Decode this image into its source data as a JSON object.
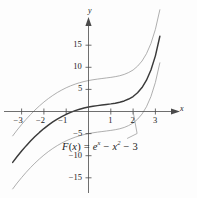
{
  "figure": {
    "background_color": "#fdfdfd",
    "axis_color": "#4a4a4a",
    "curve_main_color": "#3a3a3a",
    "curve_family_color": "#9a9a9a",
    "text_color": "#1a1a1a"
  },
  "axes": {
    "x_label": "x",
    "y_label": "y",
    "x_ticks": [
      {
        "value": -3,
        "label": "−3"
      },
      {
        "value": -2,
        "label": "−2"
      },
      {
        "value": -1,
        "label": "−1"
      },
      {
        "value": 1,
        "label": "1"
      },
      {
        "value": 2,
        "label": "2"
      },
      {
        "value": 3,
        "label": "3"
      }
    ],
    "y_ticks": [
      {
        "value": 15,
        "label": "15"
      },
      {
        "value": 10,
        "label": "10"
      },
      {
        "value": 5,
        "label": "5"
      },
      {
        "value": -5,
        "label": "−5"
      },
      {
        "value": -10,
        "label": "−10"
      },
      {
        "value": -15,
        "label": "−15"
      }
    ]
  },
  "annotation": {
    "function_text": "F(x) = e^x − x^2 − 3",
    "fx_name": "F",
    "open_paren": "(",
    "variable": "x",
    "close_paren": ")",
    "equals": "=",
    "e_base": "e",
    "e_exp": "x",
    "minus_1": "−",
    "x_term": "x",
    "x_exp": "2",
    "minus_2": "−",
    "constant": "3"
  },
  "chart_data": {
    "type": "line",
    "title": "",
    "xlabel": "x",
    "ylabel": "y",
    "xlim": [
      -3.6,
      3.4
    ],
    "ylim": [
      -19,
      19
    ],
    "grid": false,
    "legend": null,
    "annotations": [
      {
        "text": "F(x) = e^x − x^2 − 3",
        "x": 0.6,
        "y": -7.5,
        "leader_to": {
          "x": 2.0,
          "y": 0.0
        }
      }
    ],
    "x": [
      -3.4,
      -3.2,
      -3.0,
      -2.8,
      -2.6,
      -2.4,
      -2.2,
      -2.0,
      -1.8,
      -1.6,
      -1.4,
      -1.2,
      -1.0,
      -0.8,
      -0.6,
      -0.4,
      -0.2,
      0.0,
      0.2,
      0.4,
      0.6,
      0.8,
      1.0,
      1.2,
      1.4,
      1.6,
      1.8,
      2.0,
      2.2,
      2.4,
      2.6,
      2.8,
      3.0,
      3.2
    ],
    "series": [
      {
        "name": "C = 6",
        "constant": 6,
        "style": "thin",
        "color": "#9a9a9a",
        "values": [
          -5.52,
          -4.19,
          -2.95,
          -1.78,
          -0.69,
          0.33,
          1.27,
          2.14,
          2.93,
          3.64,
          4.29,
          4.86,
          5.37,
          5.81,
          6.19,
          6.51,
          6.78,
          7.0,
          7.18,
          7.33,
          7.46,
          7.59,
          7.72,
          7.88,
          8.09,
          8.39,
          8.82,
          9.39,
          10.25,
          11.42,
          13.08,
          15.39,
          18.59,
          23.02
        ]
      },
      {
        "name": "C = 0",
        "constant": 0,
        "style": "bold",
        "color": "#3a3a3a",
        "values": [
          -11.52,
          -10.19,
          -8.95,
          -7.78,
          -6.69,
          -5.67,
          -4.73,
          -3.86,
          -3.07,
          -2.36,
          -1.71,
          -1.14,
          -0.63,
          -0.19,
          0.19,
          0.51,
          0.78,
          1.0,
          1.18,
          1.33,
          1.46,
          1.59,
          1.72,
          1.88,
          2.09,
          2.39,
          2.82,
          3.39,
          4.25,
          5.42,
          7.08,
          9.39,
          12.59,
          17.02
        ]
      },
      {
        "name": "C = -6",
        "constant": -6,
        "style": "thin",
        "color": "#9a9a9a",
        "values": [
          -17.52,
          -16.19,
          -14.95,
          -13.78,
          -12.69,
          -11.67,
          -10.73,
          -9.86,
          -9.07,
          -8.36,
          -7.71,
          -7.14,
          -6.63,
          -6.19,
          -5.81,
          -5.49,
          -5.22,
          -5.0,
          -4.82,
          -4.67,
          -4.54,
          -4.41,
          -4.28,
          -4.12,
          -3.91,
          -3.61,
          -3.18,
          -2.61,
          -1.75,
          -0.58,
          1.08,
          3.39,
          6.59,
          11.02
        ]
      }
    ]
  }
}
